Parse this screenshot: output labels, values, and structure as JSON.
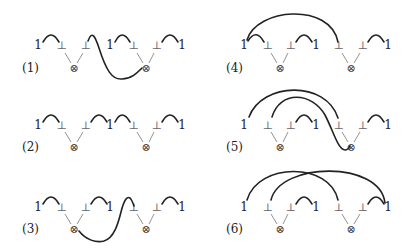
{
  "diagram": {
    "title": "",
    "panels": [
      {
        "label": "(1)",
        "label_pos": [
          22,
          72
        ],
        "tokens": [
          {
            "t": "1",
            "x": 38,
            "y": 49,
            "kind": "one"
          },
          {
            "t": "⊥",
            "x": 62,
            "y": 49,
            "kind": "bot"
          },
          {
            "t": "⊥",
            "x": 86,
            "y": 49,
            "kind": "bot"
          },
          {
            "t": "1",
            "x": 110,
            "y": 49,
            "kind": "one"
          },
          {
            "t": "⊥",
            "x": 134,
            "y": 49,
            "kind": "bot"
          },
          {
            "t": "⊥",
            "x": 157,
            "y": 49,
            "kind": "bot"
          },
          {
            "t": "1",
            "x": 182,
            "y": 49,
            "kind": "one"
          }
        ],
        "tensors": [
          {
            "t": "⊗",
            "x": 74,
            "y": 72,
            "from": [
              62,
              86
            ]
          },
          {
            "t": "⊗",
            "x": 146,
            "y": 72,
            "from": [
              134,
              157
            ]
          }
        ],
        "arcs": [
          "M43 42 Q51 28 59 42",
          "M115 42 Q122 28 130 42",
          "M162 42 Q170 28 178 42",
          "M88 41 C92 30 95 36 99 48 C106 70 112 80 122 79 C131 79 137 73 142 68"
        ]
      },
      {
        "label": "(2)",
        "label_pos": [
          22,
          151
        ],
        "tokens": [
          {
            "t": "1",
            "x": 38,
            "y": 129,
            "kind": "one"
          },
          {
            "t": "⊥",
            "x": 62,
            "y": 129,
            "kind": "bot"
          },
          {
            "t": "⊥",
            "x": 86,
            "y": 129,
            "kind": "bot"
          },
          {
            "t": "1",
            "x": 110,
            "y": 129,
            "kind": "one"
          },
          {
            "t": "⊥",
            "x": 134,
            "y": 129,
            "kind": "bot"
          },
          {
            "t": "⊥",
            "x": 157,
            "y": 129,
            "kind": "bot"
          },
          {
            "t": "1",
            "x": 182,
            "y": 129,
            "kind": "one"
          }
        ],
        "tensors": [
          {
            "t": "⊗",
            "x": 74,
            "y": 151,
            "from": [
              62,
              86
            ]
          },
          {
            "t": "⊗",
            "x": 146,
            "y": 151,
            "from": [
              134,
              157
            ]
          }
        ],
        "arcs": [
          "M43 122 Q51 108 59 122",
          "M91 122 Q99 108 107 122",
          "M115 122 Q122 108 130 122",
          "M162 122 Q170 108 178 122"
        ]
      },
      {
        "label": "(3)",
        "label_pos": [
          22,
          233
        ],
        "tokens": [
          {
            "t": "1",
            "x": 38,
            "y": 211,
            "kind": "one"
          },
          {
            "t": "⊥",
            "x": 62,
            "y": 211,
            "kind": "bot"
          },
          {
            "t": "⊥",
            "x": 86,
            "y": 211,
            "kind": "bot"
          },
          {
            "t": "1",
            "x": 110,
            "y": 211,
            "kind": "one"
          },
          {
            "t": "⊥",
            "x": 134,
            "y": 211,
            "kind": "bot"
          },
          {
            "t": "⊥",
            "x": 157,
            "y": 211,
            "kind": "bot"
          },
          {
            "t": "1",
            "x": 182,
            "y": 211,
            "kind": "one"
          }
        ],
        "tensors": [
          {
            "t": "⊗",
            "x": 74,
            "y": 233,
            "from": [
              62,
              86
            ]
          },
          {
            "t": "⊗",
            "x": 146,
            "y": 233,
            "from": [
              134,
              157
            ]
          }
        ],
        "arcs": [
          "M43 204 Q51 190 59 204",
          "M91 204 Q99 190 107 204",
          "M162 204 Q170 190 178 204",
          "M79 231 C86 240 96 243 104 241 C114 238 118 224 121 212 C124 200 127 196 130 198 C132 200 133 203 134 206"
        ]
      },
      {
        "label": "(4)",
        "label_pos": [
          226,
          72
        ],
        "tokens": [
          {
            "t": "1",
            "x": 244,
            "y": 49,
            "kind": "one"
          },
          {
            "t": "⊥",
            "x": 268,
            "y": 49,
            "kind": "bot"
          },
          {
            "t": "⊥",
            "x": 291,
            "y": 49,
            "kind": "bot"
          },
          {
            "t": "1",
            "x": 316,
            "y": 49,
            "kind": "one"
          },
          {
            "t": "⊥",
            "x": 339,
            "y": 49,
            "kind": "bot"
          },
          {
            "t": "⊥",
            "x": 363,
            "y": 49,
            "kind": "bot"
          },
          {
            "t": "1",
            "x": 388,
            "y": 49,
            "kind": "one"
          }
        ],
        "tensors": [
          {
            "t": "⊗",
            "x": 280,
            "y": 72,
            "from": [
              268,
              291
            ]
          },
          {
            "t": "⊗",
            "x": 351,
            "y": 72,
            "from": [
              339,
              363
            ]
          }
        ],
        "arcs": [
          "M248 41 Q256 28 264 42",
          "M296 42 Q304 28 312 42",
          "M368 42 Q376 28 384 42",
          "M247 40 C256 8 330 2 338 42"
        ]
      },
      {
        "label": "(5)",
        "label_pos": [
          226,
          151
        ],
        "tokens": [
          {
            "t": "1",
            "x": 244,
            "y": 129,
            "kind": "one"
          },
          {
            "t": "⊥",
            "x": 268,
            "y": 129,
            "kind": "bot"
          },
          {
            "t": "⊥",
            "x": 291,
            "y": 129,
            "kind": "bot"
          },
          {
            "t": "1",
            "x": 316,
            "y": 129,
            "kind": "one"
          },
          {
            "t": "⊥",
            "x": 339,
            "y": 129,
            "kind": "bot"
          },
          {
            "t": "⊥",
            "x": 363,
            "y": 129,
            "kind": "bot"
          },
          {
            "t": "1",
            "x": 388,
            "y": 129,
            "kind": "one"
          }
        ],
        "tensors": [
          {
            "t": "⊗",
            "x": 280,
            "y": 151,
            "from": [
              268,
              291
            ]
          },
          {
            "t": "⊗",
            "x": 351,
            "y": 151,
            "from": [
              339,
              363
            ]
          }
        ],
        "arcs": [
          "M296 122 Q304 108 312 122",
          "M368 122 Q376 108 384 122",
          "M249 117 C262 82 326 80 338 118",
          "M272 117 C280 90 312 92 325 115 C333 130 338 150 345 150 C348 150 349 148 350 146"
        ]
      },
      {
        "label": "(6)",
        "label_pos": [
          226,
          233
        ],
        "tokens": [
          {
            "t": "1",
            "x": 244,
            "y": 211,
            "kind": "one"
          },
          {
            "t": "⊥",
            "x": 268,
            "y": 211,
            "kind": "bot"
          },
          {
            "t": "⊥",
            "x": 291,
            "y": 211,
            "kind": "bot"
          },
          {
            "t": "1",
            "x": 316,
            "y": 211,
            "kind": "one"
          },
          {
            "t": "⊥",
            "x": 339,
            "y": 211,
            "kind": "bot"
          },
          {
            "t": "⊥",
            "x": 363,
            "y": 211,
            "kind": "bot"
          },
          {
            "t": "1",
            "x": 388,
            "y": 211,
            "kind": "one"
          }
        ],
        "tensors": [
          {
            "t": "⊗",
            "x": 280,
            "y": 233,
            "from": [
              268,
              291
            ]
          },
          {
            "t": "⊗",
            "x": 351,
            "y": 233,
            "from": [
              339,
              363
            ]
          }
        ],
        "arcs": [
          "M296 204 Q304 190 312 204",
          "M368 204 Q376 190 384 204",
          "M247 200 C258 162 330 162 338 200",
          "M271 200 C280 162 380 160 385 203"
        ]
      }
    ]
  }
}
